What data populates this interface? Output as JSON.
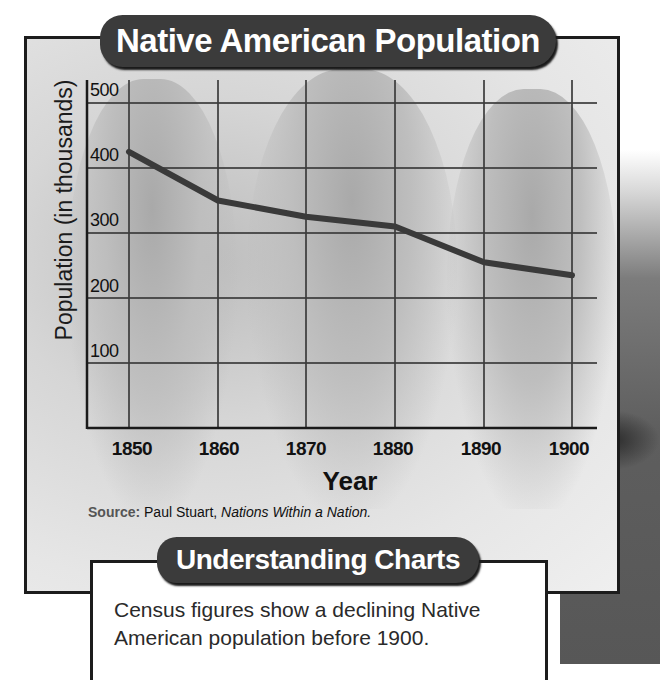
{
  "chart_data": {
    "type": "line",
    "title": "Native American Population",
    "xlabel": "Year",
    "ylabel": "Population (in thousands)",
    "categories": [
      "1850",
      "1860",
      "1870",
      "1880",
      "1890",
      "1900"
    ],
    "x": [
      1850,
      1860,
      1870,
      1880,
      1890,
      1900
    ],
    "values": [
      425,
      350,
      325,
      310,
      255,
      235
    ],
    "series": [
      {
        "name": "Native American Population (thousands)",
        "values": [
          425,
          350,
          325,
          310,
          255,
          235
        ]
      }
    ],
    "yticks": [
      "100",
      "200",
      "300",
      "400",
      "500"
    ],
    "ylim": [
      0,
      500
    ],
    "grid": true,
    "legend": null,
    "annotations": [
      "Source: Paul Stuart, Nations Within a Nation."
    ]
  },
  "header": {
    "title": "Native American Population"
  },
  "axes": {
    "ylabel": "Population (in thousands)",
    "xlabel": "Year",
    "yticks": [
      "500",
      "400",
      "300",
      "200",
      "100"
    ],
    "xticks": [
      "1850",
      "1860",
      "1870",
      "1880",
      "1890",
      "1900"
    ]
  },
  "source": {
    "label": "Source:",
    "author": " Paul Stuart, ",
    "book": "Nations Within a Nation."
  },
  "understanding": {
    "title": "Understanding Charts",
    "text": "Census figures show a declining Native American population before 1900."
  },
  "colors": {
    "line": "#3a3a3a",
    "grid": "#3c3c3c",
    "pill": "#3b3b3b",
    "pill_text": "#ffffff"
  }
}
